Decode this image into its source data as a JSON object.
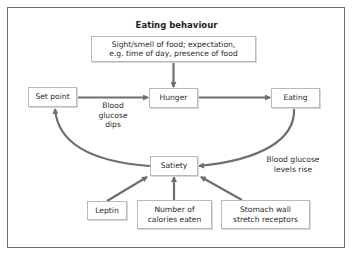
{
  "diagram": {
    "title": "Eating behaviour",
    "colors": {
      "arrow": "#6e6e6e",
      "box_border": "#b9b9b9",
      "frame_border": "#6a6a6a",
      "text": "#2a2a2a"
    },
    "nodes": {
      "cues": {
        "line1": "Sight/smell of food; expectation,",
        "line2": "e.g. time of day, presence of food"
      },
      "set_point": "Set point",
      "hunger": "Hunger",
      "eating": "Eating",
      "satiety": "Satiety",
      "leptin": "Leptin",
      "calories": {
        "line1": "Number of",
        "line2": "calories eaten"
      },
      "stomach": {
        "line1": "Stomach wall",
        "line2": "stretch receptors"
      }
    },
    "edge_labels": {
      "glucose_dips": {
        "line1": "Blood",
        "line2": "glucose",
        "line3": "dips"
      },
      "glucose_rise": {
        "line1": "Blood glucose",
        "line2": "levels rise"
      }
    },
    "edges": [
      {
        "from": "cues",
        "to": "hunger"
      },
      {
        "from": "set_point",
        "to": "hunger",
        "label": "Blood glucose dips"
      },
      {
        "from": "hunger",
        "to": "eating"
      },
      {
        "from": "eating",
        "to": "satiety",
        "label": "Blood glucose levels rise"
      },
      {
        "from": "satiety",
        "to": "set_point"
      },
      {
        "from": "leptin",
        "to": "satiety"
      },
      {
        "from": "calories",
        "to": "satiety"
      },
      {
        "from": "stomach",
        "to": "satiety"
      }
    ]
  }
}
